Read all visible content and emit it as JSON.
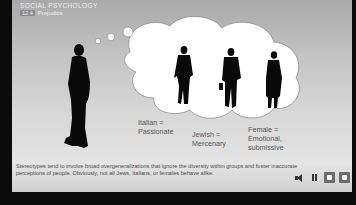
{
  "header": {
    "course_title": "Social Psychology",
    "section_number": "12.4",
    "section_title": "Prejudice"
  },
  "illustration": {
    "thinker": "silhouette-man-walking",
    "thought_bubble": {
      "figures": [
        {
          "id": "italian",
          "label_line1": "Italian =",
          "label_line2": "Passionate"
        },
        {
          "id": "jewish",
          "label_line1": "Jewish =",
          "label_line2": "Mercenary"
        },
        {
          "id": "female",
          "label_line1": "Female =",
          "label_line2": "Emotional,",
          "label_line3": "submissive"
        }
      ]
    }
  },
  "caption": "Stereotypes tend to involve broad overgeneralizations that ignore the diversity within groups and foster inaccurate perceptions of people. Obviously, not all Jews, Italians, or females behave alike.",
  "controls": {
    "volume": "volume-icon",
    "pause": "pause-icon",
    "prev": "prev-slide-button",
    "next": "next-slide-button"
  },
  "colors": {
    "frame": "#0b0b0b",
    "slide_top": "#a9a9a9",
    "slide_bottom": "#e4e4e4",
    "label_text": "#555555",
    "control_square": "#6b6b6b"
  }
}
